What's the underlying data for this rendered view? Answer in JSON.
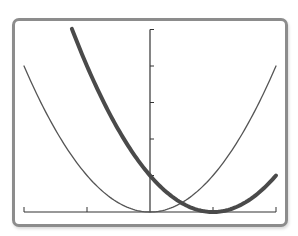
{
  "chart_data": {
    "type": "line",
    "title": "",
    "xlabel": "",
    "ylabel": "",
    "xlim": [
      -2,
      2
    ],
    "ylim": [
      0,
      5
    ],
    "x_ticks": [
      -2,
      -1,
      0,
      1,
      2
    ],
    "y_ticks": [
      1,
      2,
      3,
      4,
      5
    ],
    "tick_labels_shown": false,
    "grid": false,
    "legend": null,
    "series": [
      {
        "name": "y = x^2",
        "style": "thin",
        "color": "#555555",
        "x": [
          -2,
          -1.5,
          -1,
          -0.5,
          0,
          0.5,
          1,
          1.5,
          2
        ],
        "y": [
          4,
          2.25,
          1,
          0.25,
          0,
          0.25,
          1,
          2.25,
          4
        ]
      },
      {
        "name": "y = (x-1)^2",
        "style": "thick",
        "color": "#4a4a4a",
        "x": [
          -1.24,
          -1,
          -0.5,
          0,
          0.5,
          1,
          1.5,
          2
        ],
        "y": [
          5,
          4,
          2.25,
          1,
          0.25,
          0,
          0.25,
          1
        ]
      }
    ]
  },
  "colors": {
    "frame": "#8c8c8c",
    "axis": "#333333",
    "background": "#ffffff"
  }
}
